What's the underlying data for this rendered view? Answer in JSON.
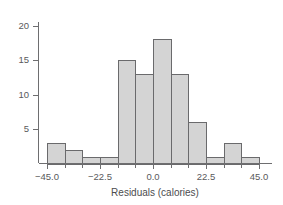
{
  "chart_data": {
    "type": "bar",
    "title": "",
    "subtitle": "",
    "xlabel": "Residuals (calories)",
    "ylabel": "",
    "grid": false,
    "legend": null,
    "bin_width": 7.5,
    "bin_edges": [
      -45.0,
      -37.5,
      -30.0,
      -22.5,
      -15.0,
      -7.5,
      0.0,
      7.5,
      15.0,
      22.5,
      30.0,
      37.5,
      45.0
    ],
    "categories": [
      "-45.0 to -37.5",
      "-37.5 to -30.0",
      "-30.0 to -22.5",
      "-22.5 to -15.0",
      "-15.0 to -7.5",
      "-7.5 to 0.0",
      "0.0 to 7.5",
      "7.5 to 15.0",
      "15.0 to 22.5",
      "22.5 to 30.0",
      "30.0 to 37.5",
      "37.5 to 45.0"
    ],
    "values": [
      3,
      2,
      1,
      1,
      15,
      13,
      18,
      13,
      6,
      1,
      3,
      1
    ],
    "xlim": [
      -45.0,
      45.0
    ],
    "ylim": [
      0,
      21
    ],
    "xticks": [
      -45.0,
      -22.5,
      0.0,
      22.5,
      45.0
    ],
    "xticklabels": [
      "−45.0",
      "−22.5",
      "0.0",
      "22.5",
      "45.0"
    ],
    "yticks": [
      5,
      10,
      15,
      20
    ],
    "yticklabels": [
      "5",
      "10",
      "15",
      "20"
    ],
    "colors": {
      "bar_fill": "#d4d4d4",
      "bar_stroke": "#6a6a6c",
      "axis": "#6e6e70",
      "text": "#59595b",
      "background": "#ffffff"
    }
  }
}
